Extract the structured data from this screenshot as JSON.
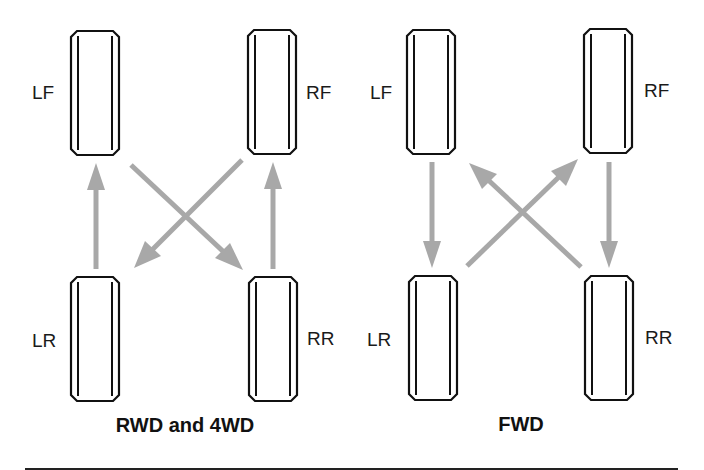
{
  "panels": [
    {
      "id": "rwd-4wd",
      "caption": "RWD and 4WD",
      "tires": [
        {
          "position": "LF",
          "label": "LF"
        },
        {
          "position": "RF",
          "label": "RF"
        },
        {
          "position": "LR",
          "label": "LR"
        },
        {
          "position": "RR",
          "label": "RR"
        }
      ],
      "rotation_moves": [
        {
          "from": "LR",
          "to": "LF",
          "type": "straight"
        },
        {
          "from": "RR",
          "to": "RF",
          "type": "straight"
        },
        {
          "from": "LF",
          "to": "RR",
          "type": "cross"
        },
        {
          "from": "RF",
          "to": "LR",
          "type": "cross"
        }
      ]
    },
    {
      "id": "fwd",
      "caption": "FWD",
      "tires": [
        {
          "position": "LF",
          "label": "LF"
        },
        {
          "position": "RF",
          "label": "RF"
        },
        {
          "position": "LR",
          "label": "LR"
        },
        {
          "position": "RR",
          "label": "RR"
        }
      ],
      "rotation_moves": [
        {
          "from": "LF",
          "to": "LR",
          "type": "straight"
        },
        {
          "from": "RF",
          "to": "RR",
          "type": "straight"
        },
        {
          "from": "LR",
          "to": "RF",
          "type": "cross"
        },
        {
          "from": "RR",
          "to": "LF",
          "type": "cross"
        }
      ]
    }
  ],
  "colors": {
    "arrow": "#a8a8a8",
    "tire_outline": "#111111",
    "text": "#111111",
    "background": "#ffffff"
  }
}
